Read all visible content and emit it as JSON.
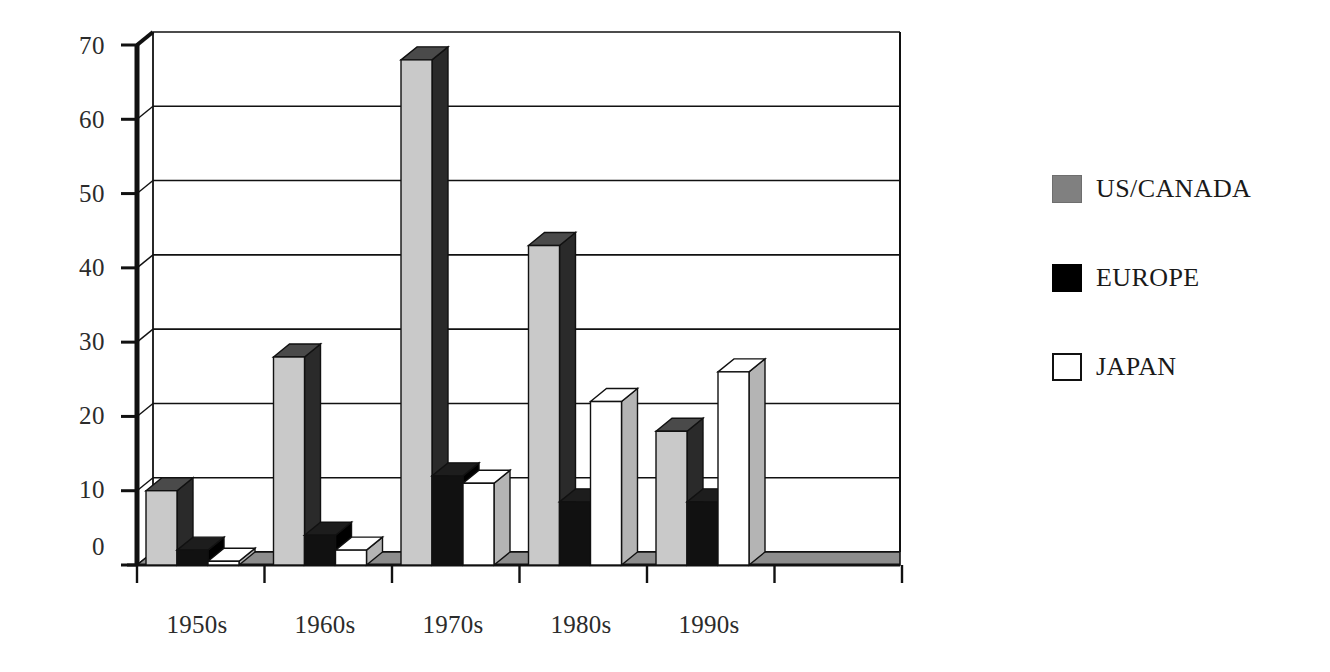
{
  "chart_data": {
    "type": "bar",
    "title": "",
    "subtitle": "",
    "xlabel": "",
    "ylabel": "",
    "categories": [
      "1950s",
      "1960s",
      "1970s",
      "1980s",
      "1990s"
    ],
    "series": [
      {
        "name": "US/CANADA",
        "color": "#c9c9c9",
        "legend_color": "#808080",
        "values": [
          10,
          28,
          68,
          43,
          18
        ]
      },
      {
        "name": "EUROPE",
        "color": "#000000",
        "legend_color": "#000000",
        "values": [
          2,
          4,
          12,
          8.5,
          8.5
        ]
      },
      {
        "name": "JAPAN",
        "color": "#ffffff",
        "legend_color": "#ffffff",
        "values": [
          0.5,
          2,
          11,
          22,
          26
        ]
      }
    ],
    "ylim": [
      0,
      70
    ],
    "yticks": [
      0,
      10,
      20,
      30,
      40,
      50,
      60,
      70
    ],
    "ytick_labels": [
      "0",
      "10",
      "20",
      "30",
      "40",
      "50",
      "60",
      "70"
    ],
    "grid": true,
    "grid_axis": "y",
    "legend_position": "right",
    "style": "3d-bars"
  },
  "legend": {
    "entries": [
      {
        "label": "US/CANADA",
        "swatch": "gray-swatch-icon"
      },
      {
        "label": "EUROPE",
        "swatch": "black-swatch-icon"
      },
      {
        "label": "JAPAN",
        "swatch": "white-swatch-icon"
      }
    ]
  },
  "axes": {
    "y_tick_labels": [
      "70",
      "60",
      "50",
      "40",
      "30",
      "20",
      "10",
      "0"
    ],
    "x_tick_labels": [
      "1950s",
      "1960s",
      "1970s",
      "1980s",
      "1990s"
    ]
  }
}
